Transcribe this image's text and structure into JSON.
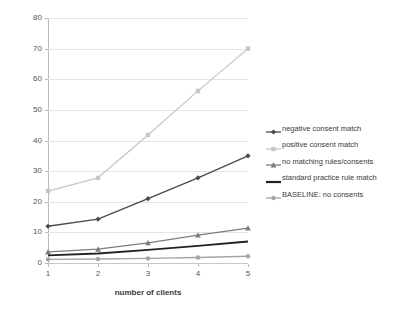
{
  "chart_data": {
    "type": "line",
    "title": "",
    "xlabel": "number of clients",
    "ylabel": "response time in milliseconds",
    "x": [
      1,
      2,
      3,
      4,
      5
    ],
    "categories": [
      "1",
      "2",
      "3",
      "4",
      "5"
    ],
    "xlim": [
      1,
      5
    ],
    "ylim": [
      0,
      80
    ],
    "y_ticks": [
      0,
      10,
      20,
      30,
      40,
      50,
      60,
      70,
      80
    ],
    "x_ticks": [
      "1",
      "2",
      "3",
      "4",
      "5"
    ],
    "grid": true,
    "legend_position": "right",
    "series": [
      {
        "name": "negative consent match",
        "color": "#4a4a4a",
        "marker": "diamond",
        "values": [
          12.0,
          14.3,
          21.0,
          27.8,
          35.0
        ]
      },
      {
        "name": "positive consent match",
        "color": "#c6c6c6",
        "marker": "square",
        "values": [
          23.5,
          27.8,
          41.8,
          56.2,
          70.0
        ]
      },
      {
        "name": "no matching rules/consents",
        "color": "#7d7d7d",
        "marker": "triangle",
        "values": [
          3.6,
          4.5,
          6.6,
          9.1,
          11.4
        ]
      },
      {
        "name": "standard practice rule match",
        "color": "#222222",
        "marker": "none",
        "values": [
          2.5,
          3.1,
          4.3,
          5.6,
          7.0
        ]
      },
      {
        "name": "BASELINE: no consents",
        "color": "#a5a5a5",
        "marker": "circle",
        "values": [
          1.2,
          1.3,
          1.5,
          1.8,
          2.2
        ]
      }
    ]
  }
}
